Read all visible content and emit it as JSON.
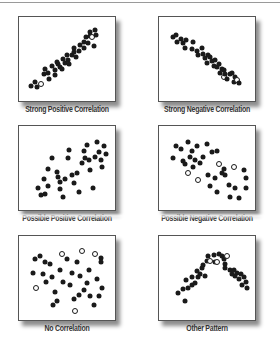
{
  "chart_data": [
    {
      "type": "scatter",
      "title": "Strong Positive Correlation",
      "xlabel": "",
      "ylabel": "",
      "grid": false,
      "points": [
        [
          10,
          88
        ],
        [
          14,
          82
        ],
        [
          17,
          89
        ],
        [
          21,
          85,
          "open"
        ],
        [
          25,
          72
        ],
        [
          26,
          64
        ],
        [
          30,
          70
        ],
        [
          31,
          78
        ],
        [
          34,
          60
        ],
        [
          38,
          66
        ],
        [
          38,
          73
        ],
        [
          40,
          55
        ],
        [
          42,
          58
        ],
        [
          44,
          62
        ],
        [
          46,
          64
        ],
        [
          48,
          51
        ],
        [
          50,
          56
        ],
        [
          52,
          46
        ],
        [
          54,
          52
        ],
        [
          55,
          58
        ],
        [
          58,
          46
        ],
        [
          60,
          42
        ],
        [
          61,
          36
        ],
        [
          63,
          48
        ],
        [
          66,
          40
        ],
        [
          68,
          32
        ],
        [
          72,
          28
        ],
        [
          72,
          36
        ],
        [
          75,
          22
        ],
        [
          77,
          30
        ],
        [
          80,
          20
        ],
        [
          80,
          14
        ],
        [
          82,
          22,
          "open"
        ],
        [
          85,
          12
        ],
        [
          87,
          18
        ],
        [
          84,
          34
        ]
      ]
    },
    {
      "type": "scatter",
      "title": "Strong Negative Correlation",
      "xlabel": "",
      "ylabel": "",
      "grid": false,
      "points": [
        [
          12,
          22
        ],
        [
          16,
          18
        ],
        [
          17,
          28
        ],
        [
          21,
          24
        ],
        [
          24,
          30
        ],
        [
          26,
          36
        ],
        [
          28,
          26
        ],
        [
          36,
          28
        ],
        [
          34,
          38
        ],
        [
          40,
          40
        ],
        [
          42,
          46
        ],
        [
          46,
          36
        ],
        [
          48,
          44
        ],
        [
          50,
          50
        ],
        [
          52,
          56
        ],
        [
          54,
          46
        ],
        [
          56,
          48
        ],
        [
          58,
          54
        ],
        [
          60,
          60
        ],
        [
          62,
          52
        ],
        [
          64,
          62
        ],
        [
          66,
          58
        ],
        [
          68,
          70
        ],
        [
          70,
          64
        ],
        [
          72,
          66
        ],
        [
          72,
          76,
          "open"
        ],
        [
          74,
          72
        ],
        [
          76,
          78
        ],
        [
          80,
          72
        ],
        [
          82,
          70
        ],
        [
          84,
          82
        ],
        [
          86,
          76
        ],
        [
          88,
          80,
          "open"
        ],
        [
          90,
          84
        ]
      ]
    },
    {
      "type": "scatter",
      "title": "Possible Positive Correlation",
      "xlabel": "",
      "ylabel": "",
      "grid": false,
      "points": [
        [
          18,
          78
        ],
        [
          22,
          87
        ],
        [
          25,
          66
        ],
        [
          30,
          75
        ],
        [
          30,
          52
        ],
        [
          26,
          86
        ],
        [
          34,
          38
        ],
        [
          40,
          56
        ],
        [
          42,
          63
        ],
        [
          44,
          70
        ],
        [
          44,
          80
        ],
        [
          48,
          90
        ],
        [
          50,
          66
        ],
        [
          54,
          38
        ],
        [
          55,
          27
        ],
        [
          58,
          60
        ],
        [
          60,
          72
        ],
        [
          64,
          58
        ],
        [
          66,
          84
        ],
        [
          70,
          45
        ],
        [
          72,
          28
        ],
        [
          74,
          38
        ],
        [
          76,
          20
        ],
        [
          78,
          40
        ],
        [
          80,
          54
        ],
        [
          83,
          78
        ],
        [
          86,
          36
        ],
        [
          90,
          30
        ],
        [
          92,
          40
        ],
        [
          94,
          50
        ],
        [
          96,
          22
        ],
        [
          98,
          32
        ],
        [
          88,
          16
        ]
      ]
    },
    {
      "type": "scatter",
      "title": "Possible Negative Correlation",
      "xlabel": "",
      "ylabel": "",
      "grid": false,
      "points": [
        [
          12,
          38
        ],
        [
          16,
          22
        ],
        [
          22,
          26
        ],
        [
          24,
          42
        ],
        [
          26,
          46
        ],
        [
          30,
          58,
          "open"
        ],
        [
          30,
          16
        ],
        [
          32,
          36
        ],
        [
          34,
          28
        ],
        [
          36,
          50
        ],
        [
          38,
          40
        ],
        [
          40,
          22
        ],
        [
          42,
          68,
          "open"
        ],
        [
          44,
          44
        ],
        [
          48,
          36
        ],
        [
          52,
          18
        ],
        [
          54,
          60
        ],
        [
          56,
          76
        ],
        [
          58,
          30
        ],
        [
          62,
          64
        ],
        [
          64,
          84
        ],
        [
          64,
          28
        ],
        [
          66,
          46,
          "open"
        ],
        [
          70,
          58
        ],
        [
          72,
          52
        ],
        [
          74,
          60
        ],
        [
          78,
          74
        ],
        [
          80,
          90
        ],
        [
          84,
          50,
          "open"
        ],
        [
          86,
          78
        ],
        [
          90,
          92
        ],
        [
          96,
          54
        ],
        [
          98,
          64
        ],
        [
          98,
          78
        ]
      ]
    },
    {
      "type": "scatter",
      "title": "No Correlation",
      "xlabel": "",
      "ylabel": "",
      "grid": false,
      "points": [
        [
          14,
          26
        ],
        [
          12,
          44
        ],
        [
          16,
          64,
          "open"
        ],
        [
          20,
          22
        ],
        [
          26,
          30
        ],
        [
          24,
          46
        ],
        [
          28,
          56
        ],
        [
          32,
          32
        ],
        [
          34,
          50
        ],
        [
          36,
          88
        ],
        [
          38,
          70
        ],
        [
          40,
          82
        ],
        [
          44,
          40
        ],
        [
          46,
          18,
          "open"
        ],
        [
          48,
          56
        ],
        [
          52,
          26
        ],
        [
          56,
          60
        ],
        [
          58,
          44
        ],
        [
          60,
          80
        ],
        [
          62,
          96,
          "open"
        ],
        [
          64,
          30
        ],
        [
          66,
          74
        ],
        [
          68,
          48
        ],
        [
          70,
          14,
          "open"
        ],
        [
          72,
          68
        ],
        [
          76,
          58
        ],
        [
          78,
          40
        ],
        [
          80,
          76
        ],
        [
          84,
          88
        ],
        [
          86,
          18,
          "open"
        ],
        [
          88,
          52
        ],
        [
          90,
          76
        ],
        [
          92,
          24
        ],
        [
          94,
          64
        ],
        [
          92,
          30
        ]
      ]
    },
    {
      "type": "scatter",
      "title": "Other Pattern",
      "xlabel": "",
      "ylabel": "",
      "grid": false,
      "points": [
        [
          18,
          72
        ],
        [
          24,
          66
        ],
        [
          26,
          82
        ],
        [
          28,
          54
        ],
        [
          30,
          64
        ],
        [
          34,
          50
        ],
        [
          34,
          60
        ],
        [
          38,
          58
        ],
        [
          40,
          42
        ],
        [
          42,
          50
        ],
        [
          44,
          46
        ],
        [
          46,
          38
        ],
        [
          48,
          34
        ],
        [
          50,
          48
        ],
        [
          52,
          28
        ],
        [
          54,
          22
        ],
        [
          56,
          28,
          "open"
        ],
        [
          60,
          20
        ],
        [
          62,
          30
        ],
        [
          64,
          30,
          "open"
        ],
        [
          66,
          18
        ],
        [
          70,
          22
        ],
        [
          72,
          26
        ],
        [
          74,
          32
        ],
        [
          74,
          38
        ],
        [
          76,
          22,
          "open"
        ],
        [
          80,
          40
        ],
        [
          82,
          46
        ],
        [
          84,
          40
        ],
        [
          86,
          48
        ],
        [
          88,
          44
        ],
        [
          90,
          52
        ],
        [
          92,
          46
        ],
        [
          94,
          60
        ],
        [
          96,
          50
        ],
        [
          98,
          56
        ],
        [
          100,
          64
        ]
      ]
    }
  ],
  "panels": [
    {
      "caption": "Strong Positive Correlation"
    },
    {
      "caption": "Strong Negative Correlation"
    },
    {
      "caption": "Possible Positive Correlation"
    },
    {
      "caption": "Possible Negative Correlation"
    },
    {
      "caption": "No Correlation"
    },
    {
      "caption": "Other Pattern"
    }
  ],
  "legend": {
    "filled_dot": "data point",
    "open_dot": "outlier / highlighted point"
  }
}
